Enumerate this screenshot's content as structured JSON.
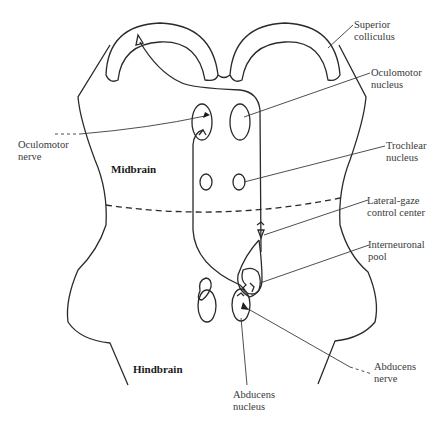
{
  "diagram": {
    "regions": {
      "midbrain": "Midbrain",
      "hindbrain": "Hindbrain"
    },
    "labels": {
      "superior_colliculus": [
        "Superior",
        "colliculus"
      ],
      "oculomotor_nucleus": [
        "Oculomotor",
        "nucleus"
      ],
      "oculomotor_nerve": [
        "Oculomotor",
        "nerve"
      ],
      "trochlear_nucleus": [
        "Trochlear",
        "nucleus"
      ],
      "lateral_gaze_center": [
        "Lateral-gaze",
        "control center"
      ],
      "interneuronal_pool": [
        "Interneuronal",
        "pool"
      ],
      "abducens_nerve": [
        "Abducens",
        "nerve"
      ],
      "abducens_nucleus": [
        "Abducens",
        "nucleus"
      ]
    },
    "colors": {
      "stroke": "#2a2a2a",
      "text": "#3a3a3a",
      "background": "#ffffff"
    }
  }
}
